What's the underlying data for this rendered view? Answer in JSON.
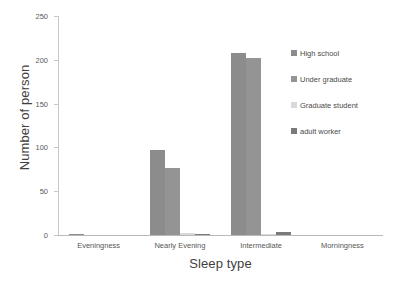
{
  "chart_data": {
    "type": "bar",
    "title": "",
    "xlabel": "Sleep type",
    "ylabel": "Number of person",
    "categories": [
      "Eveningness",
      "Nearly Evening",
      "Intermediate",
      "Morningness"
    ],
    "series": [
      {
        "name": "High school",
        "color": "#8c8c8c",
        "values": [
          1,
          97,
          208,
          0
        ]
      },
      {
        "name": "Under graduate",
        "color": "#949494",
        "values": [
          0,
          77,
          202,
          0
        ]
      },
      {
        "name": "Graduate student",
        "color": "#d9d9d9",
        "values": [
          0,
          2,
          1,
          0
        ]
      },
      {
        "name": "adult worker",
        "color": "#7a7a7a",
        "values": [
          0,
          1,
          3,
          0
        ]
      }
    ],
    "ylim": [
      0,
      250
    ],
    "yticks": [
      0,
      50,
      100,
      150,
      200,
      250
    ],
    "ytick_labels": [
      "0",
      "50",
      "100",
      "150",
      "200",
      "250"
    ],
    "grid": false,
    "legend_position": "right"
  },
  "axes": {
    "y_title": "Number of person",
    "x_title": "Sleep type"
  }
}
